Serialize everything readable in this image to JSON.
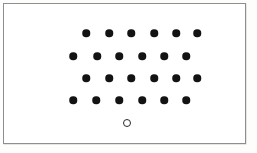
{
  "figure": {
    "frame": {
      "x": 3,
      "y": 3,
      "width": 243,
      "height": 141,
      "border_color": "#8e8e8e",
      "fill_color": "#ffffff"
    },
    "canvas": {
      "width": 257,
      "height": 153,
      "background_color": "#fdfdfc"
    }
  },
  "chart_data": {
    "type": "scatter",
    "xlabel": "",
    "ylabel": "",
    "xlim": [
      0,
      243
    ],
    "ylim": [
      0,
      141
    ],
    "grid": false,
    "legend": null,
    "marker_colors": {
      "filled": "#131313",
      "hollow_stroke": "#2a2a2a",
      "hollow_fill": "none"
    },
    "marker_sizes": {
      "filled_diameter": 7.5,
      "hollow_diameter": 8
    },
    "counts": {
      "filled_total": 24,
      "hollow_total": 1,
      "rows": 4,
      "dots_per_row": 6
    },
    "series": [
      {
        "name": "filled-dots",
        "marker": "filled-circle",
        "color": "#131313",
        "rows": [
          {
            "row_index": 1,
            "y": 29,
            "x": [
              82,
              105,
              127,
              150,
              172,
              193
            ]
          },
          {
            "row_index": 2,
            "y": 52,
            "x": [
              69,
              93,
              115,
              138,
              160,
              182
            ]
          },
          {
            "row_index": 3,
            "y": 74,
            "x": [
              82,
              105,
              127,
              150,
              172,
              193
            ]
          },
          {
            "row_index": 4,
            "y": 96,
            "x": [
              69,
              92,
              115,
              138,
              160,
              182
            ]
          }
        ],
        "points": [
          {
            "x": 82,
            "y": 29
          },
          {
            "x": 105,
            "y": 29
          },
          {
            "x": 127,
            "y": 29
          },
          {
            "x": 150,
            "y": 29
          },
          {
            "x": 172,
            "y": 29
          },
          {
            "x": 193,
            "y": 29
          },
          {
            "x": 69,
            "y": 52
          },
          {
            "x": 93,
            "y": 52
          },
          {
            "x": 115,
            "y": 52
          },
          {
            "x": 138,
            "y": 52
          },
          {
            "x": 160,
            "y": 52
          },
          {
            "x": 182,
            "y": 52
          },
          {
            "x": 82,
            "y": 74
          },
          {
            "x": 105,
            "y": 74
          },
          {
            "x": 127,
            "y": 74
          },
          {
            "x": 150,
            "y": 74
          },
          {
            "x": 172,
            "y": 74
          },
          {
            "x": 193,
            "y": 74
          },
          {
            "x": 69,
            "y": 96
          },
          {
            "x": 92,
            "y": 96
          },
          {
            "x": 115,
            "y": 96
          },
          {
            "x": 138,
            "y": 96
          },
          {
            "x": 160,
            "y": 96
          },
          {
            "x": 182,
            "y": 96
          }
        ]
      },
      {
        "name": "hollow-dot",
        "marker": "open-circle",
        "color": "#2a2a2a",
        "points": [
          {
            "x": 123,
            "y": 119
          }
        ]
      }
    ]
  }
}
